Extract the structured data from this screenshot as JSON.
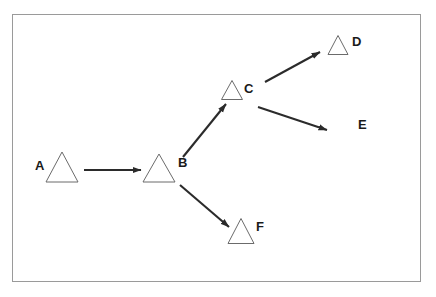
{
  "figure": {
    "title": "",
    "background_color": "#ffffff",
    "border_color": "#9a9a9a",
    "node_stroke_color": "#6b6b6b",
    "edge_color": "#2b2b2b",
    "label_color": "#1a1a1a",
    "frame": {
      "x": 12,
      "y": 14,
      "width": 408,
      "height": 267
    }
  },
  "chart_data": {
    "type": "diagram",
    "subtype": "directed-graph",
    "title": "",
    "nodes": [
      {
        "id": "A",
        "label": "A",
        "shape": "triangle",
        "has_shape": true,
        "label_side": "left",
        "cx": 62,
        "cy": 167,
        "tri_width": 32,
        "tri_height": 30,
        "label_x": 35,
        "label_y": 167
      },
      {
        "id": "B",
        "label": "B",
        "shape": "triangle",
        "has_shape": true,
        "label_side": "right",
        "cx": 159,
        "cy": 168,
        "tri_width": 32,
        "tri_height": 28,
        "label_x": 178,
        "label_y": 164
      },
      {
        "id": "C",
        "label": "C",
        "shape": "triangle",
        "has_shape": true,
        "label_side": "right",
        "cx": 232,
        "cy": 90,
        "tri_width": 21,
        "tri_height": 19,
        "label_x": 244,
        "label_y": 90
      },
      {
        "id": "D",
        "label": "D",
        "shape": "triangle",
        "has_shape": true,
        "label_side": "right",
        "cx": 338,
        "cy": 45,
        "tri_width": 20,
        "tri_height": 19,
        "label_x": 352,
        "label_y": 43
      },
      {
        "id": "E",
        "label": "E",
        "shape": "none",
        "has_shape": false,
        "label_side": "center",
        "cx": 360,
        "cy": 126,
        "tri_width": 0,
        "tri_height": 0,
        "label_x": 358,
        "label_y": 126
      },
      {
        "id": "F",
        "label": "F",
        "shape": "triangle",
        "has_shape": true,
        "label_side": "right",
        "cx": 241,
        "cy": 231,
        "tri_width": 26,
        "tri_height": 25,
        "label_x": 256,
        "label_y": 228
      }
    ],
    "edges": [
      {
        "id": "A-B",
        "source": "A",
        "target": "B",
        "x1": 84,
        "y1": 170,
        "x2": 141,
        "y2": 170,
        "directed": true
      },
      {
        "id": "B-C",
        "source": "B",
        "target": "C",
        "x1": 183,
        "y1": 157,
        "x2": 226,
        "y2": 104,
        "directed": true
      },
      {
        "id": "C-D",
        "source": "C",
        "target": "D",
        "x1": 265,
        "y1": 82,
        "x2": 320,
        "y2": 52,
        "directed": true
      },
      {
        "id": "C-E",
        "source": "C",
        "target": "E",
        "x1": 258,
        "y1": 107,
        "x2": 327,
        "y2": 130,
        "directed": true
      },
      {
        "id": "B-F",
        "source": "B",
        "target": "F",
        "x1": 180,
        "y1": 185,
        "x2": 229,
        "y2": 227,
        "directed": true
      }
    ],
    "edge_count": 5,
    "node_count": 6,
    "legend": [],
    "annotations": []
  }
}
